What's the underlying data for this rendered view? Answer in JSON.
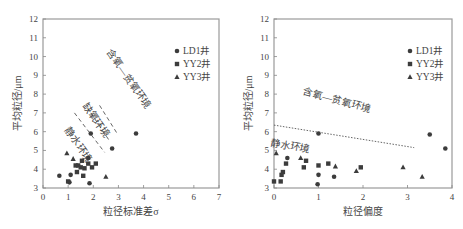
{
  "chart_data": [
    {
      "type": "scatter",
      "title": "",
      "xlabel": "粒径标准差σ",
      "ylabel": "平均粒径/μm",
      "xlim": [
        0,
        7
      ],
      "ylim": [
        3,
        12
      ],
      "xticks": [
        "0",
        "1",
        "2",
        "3",
        "4",
        "5",
        "6",
        "7"
      ],
      "yticks": [
        "3",
        "4",
        "5",
        "6",
        "7",
        "8",
        "9",
        "10",
        "11",
        "12"
      ],
      "grid": false,
      "legend_position": "upper right",
      "legend": [
        "LD1井",
        "YY2井",
        "YY3井"
      ],
      "series": [
        {
          "name": "LD1井",
          "marker": "circle",
          "points": [
            [
              0.65,
              3.65
            ],
            [
              1.05,
              3.3
            ],
            [
              1.1,
              3.7
            ],
            [
              1.85,
              3.25
            ],
            [
              1.8,
              4.6
            ],
            [
              1.9,
              5.9
            ],
            [
              2.75,
              5.1
            ],
            [
              3.7,
              5.9
            ]
          ]
        },
        {
          "name": "YY2井",
          "marker": "square",
          "points": [
            [
              1.0,
              3.35
            ],
            [
              1.3,
              4.2
            ],
            [
              1.35,
              3.85
            ],
            [
              1.4,
              4.2
            ],
            [
              1.5,
              4.1
            ],
            [
              1.55,
              4.45
            ],
            [
              1.6,
              3.65
            ],
            [
              1.65,
              4.05
            ],
            [
              1.8,
              4.3
            ],
            [
              1.95,
              4.1
            ],
            [
              2.1,
              4.3
            ]
          ]
        },
        {
          "name": "YY3井",
          "marker": "triangle",
          "points": [
            [
              0.95,
              4.85
            ],
            [
              1.2,
              4.55
            ],
            [
              2.5,
              3.6
            ]
          ]
        }
      ],
      "annotations": [
        {
          "text": "静水环境",
          "x": 1.3,
          "y": 5.2,
          "rotation": 55
        },
        {
          "text": "缺氧环境",
          "x": 2.0,
          "y": 6.5,
          "rotation": 55
        },
        {
          "text": "含氧—贫氧环境",
          "x": 3.3,
          "y": 8.7,
          "rotation": 55
        }
      ],
      "divider_lines": [
        {
          "style": "dashed",
          "from": [
            1.25,
            7.0
          ],
          "to": [
            2.45,
            4.9
          ]
        },
        {
          "style": "dashed",
          "from": [
            1.9,
            7.0
          ],
          "to": [
            2.65,
            5.5
          ]
        },
        {
          "style": "dashed",
          "from": [
            2.25,
            7.4
          ],
          "to": [
            2.95,
            5.9
          ]
        }
      ]
    },
    {
      "type": "scatter",
      "title": "",
      "xlabel": "粒径偏度",
      "ylabel": "平均粒径/μm",
      "xlim": [
        0,
        4
      ],
      "ylim": [
        3,
        12
      ],
      "xticks": [
        "0",
        "1",
        "2",
        "3",
        "4"
      ],
      "yticks": [
        "3",
        "4",
        "5",
        "6",
        "7",
        "8",
        "9",
        "10",
        "11",
        "12"
      ],
      "grid": false,
      "legend_position": "upper right",
      "legend": [
        "LD1井",
        "YY2井",
        "YY3井"
      ],
      "series": [
        {
          "name": "LD1井",
          "marker": "circle",
          "points": [
            [
              0.3,
              4.6
            ],
            [
              0.98,
              3.2
            ],
            [
              1.0,
              3.7
            ],
            [
              1.0,
              5.9
            ],
            [
              1.35,
              3.6
            ],
            [
              3.5,
              5.85
            ],
            [
              3.85,
              5.1
            ]
          ]
        },
        {
          "name": "YY2井",
          "marker": "square",
          "points": [
            [
              0.0,
              3.35
            ],
            [
              0.15,
              3.35
            ],
            [
              0.17,
              3.7
            ],
            [
              0.2,
              3.85
            ],
            [
              0.27,
              4.3
            ],
            [
              0.67,
              4.1
            ],
            [
              0.72,
              4.45
            ],
            [
              1.0,
              4.2
            ],
            [
              1.22,
              4.3
            ],
            [
              1.95,
              4.1
            ]
          ]
        },
        {
          "name": "YY3井",
          "marker": "triangle",
          "points": [
            [
              0.05,
              4.85
            ],
            [
              0.6,
              4.6
            ],
            [
              1.38,
              4.15
            ],
            [
              1.85,
              3.9
            ],
            [
              2.9,
              4.1
            ],
            [
              3.33,
              3.6
            ]
          ]
        }
      ],
      "annotations": [
        {
          "text": "含氧—贫氧环境",
          "x": 1.4,
          "y": 7.5,
          "rotation": 15
        },
        {
          "text": "静水环境",
          "x": 0.35,
          "y": 5.05,
          "rotation": 10
        }
      ],
      "divider_lines": [
        {
          "style": "dotted",
          "from": [
            0.0,
            6.35
          ],
          "to": [
            3.15,
            5.15
          ]
        }
      ]
    }
  ],
  "caption": "图 粒径参数关系图（平均粒径与标准差、偏度）"
}
